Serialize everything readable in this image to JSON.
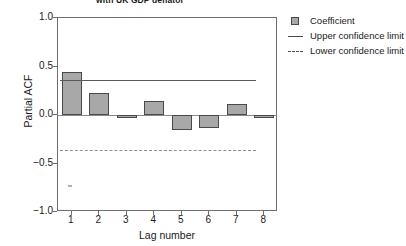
{
  "chart_data": {
    "type": "bar",
    "title": "with UK GDP deflator",
    "xlabel": "Lag number",
    "ylabel": "Partial ACF",
    "categories": [
      "1",
      "2",
      "3",
      "4",
      "5",
      "6",
      "7",
      "8"
    ],
    "values": [
      0.44,
      0.23,
      -0.02,
      0.14,
      -0.15,
      -0.13,
      0.11,
      -0.03
    ],
    "series": [
      {
        "name": "Coefficient",
        "values": [
          0.44,
          0.23,
          -0.02,
          0.14,
          -0.15,
          -0.13,
          0.11,
          -0.03
        ]
      }
    ],
    "ylim": [
      -1.0,
      1.0
    ],
    "xlim": [
      0.5,
      8.5
    ],
    "yticks": [
      "1.0",
      "0.5",
      "0.0",
      "-0.5",
      "-1.0"
    ],
    "ytick_values": [
      1.0,
      0.5,
      0.0,
      -0.5,
      -1.0
    ],
    "xticks": [
      "1",
      "2",
      "3",
      "4",
      "5",
      "6",
      "7",
      "8"
    ],
    "grid": false,
    "legend_position": "right-top",
    "reference_lines": [
      {
        "name": "Upper confidence limit",
        "value": 0.36,
        "style": "solid"
      },
      {
        "name": "Lower confidence limit",
        "value": -0.36,
        "style": "dashed"
      },
      {
        "name": "Zero line",
        "value": 0.0,
        "style": "solid"
      }
    ],
    "colors": {
      "bar_fill": "#a8a8a8",
      "bar_edge": "#4a4a4a",
      "upper_limit": "#5a5a5a",
      "lower_limit": "#8e8e8e",
      "axis": "#6f6f6f",
      "background": "#ffffff"
    }
  },
  "legend": {
    "items": [
      {
        "label": "Coefficient",
        "key": "swatch"
      },
      {
        "label": "Upper confidence limit",
        "key": "solid-line"
      },
      {
        "label": "Lower confidence limit",
        "key": "dashed-line"
      }
    ]
  }
}
